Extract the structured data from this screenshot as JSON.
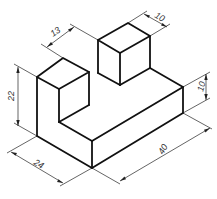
{
  "diagram": {
    "type": "isometric-technical-drawing",
    "colors": {
      "line": "#111111",
      "dimension": "#222222",
      "background": "#ffffff"
    },
    "dimensions": {
      "top_block_width": "10",
      "gap_offset": "13",
      "left_height": "22",
      "base_height": "10",
      "depth": "24",
      "length": "40"
    }
  }
}
